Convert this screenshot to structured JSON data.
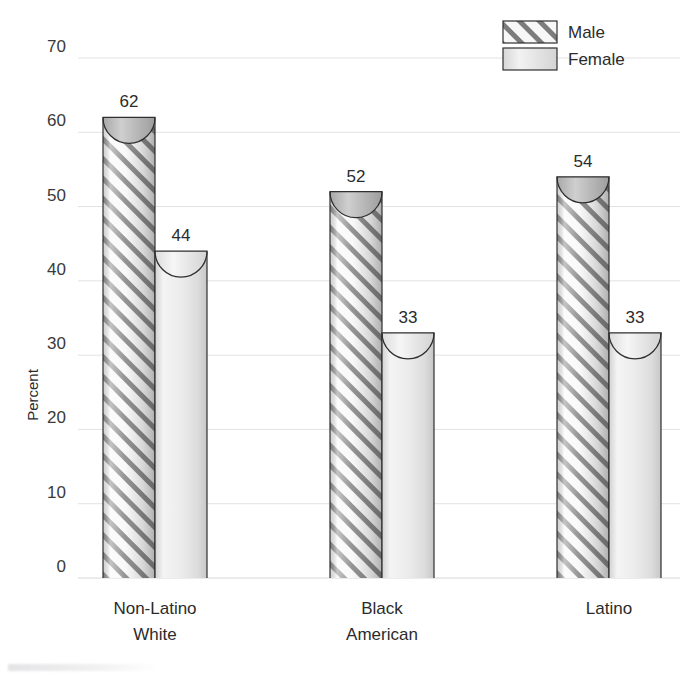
{
  "chart_data": {
    "type": "bar",
    "title": "",
    "subtitle": "",
    "xlabel": "",
    "ylabel": "Percent",
    "ylim": [
      0,
      70
    ],
    "yticks": [
      0,
      10,
      20,
      30,
      40,
      50,
      60,
      70
    ],
    "ytick_labels": [
      "0",
      "10",
      "20",
      "30",
      "40",
      "50",
      "60",
      "70"
    ],
    "grid": true,
    "legend_position": "top-right",
    "categories": [
      "Non-Latino White",
      "Black American",
      "Latino"
    ],
    "category_lines": [
      [
        "Non-Latino",
        "White"
      ],
      [
        "Black",
        "American"
      ],
      [
        "Latino"
      ]
    ],
    "series": [
      {
        "name": "Male",
        "values": [
          62,
          52,
          54
        ],
        "fill": "hatch-diagonal",
        "color": "#b9b9b9"
      },
      {
        "name": "Female",
        "values": [
          44,
          33,
          33
        ],
        "fill": "solid-light",
        "color": "#e6e6e6"
      }
    ],
    "data_labels": [
      "62",
      "44",
      "52",
      "33",
      "54",
      "33"
    ],
    "bar_style": "cylinder-3d"
  },
  "legend": {
    "items": [
      {
        "label": "Male",
        "swatch": "hatched-swatch"
      },
      {
        "label": "Female",
        "swatch": "solid-swatch"
      }
    ]
  },
  "axes": {
    "y_title": "Percent",
    "y_ticks": [
      "70",
      "60",
      "50",
      "40",
      "30",
      "20",
      "10",
      "0"
    ]
  },
  "colors": {
    "grid": "#e2e2e4",
    "outline": "#2f2f2f",
    "male_fill": "#b9b9b9",
    "female_fill": "#e6e6e6",
    "text": "#2b2b2b",
    "background": "#ffffff"
  }
}
